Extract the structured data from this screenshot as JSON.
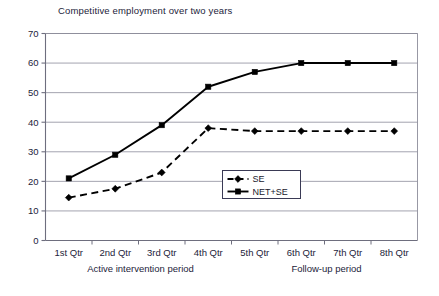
{
  "chart_data": {
    "type": "line",
    "title": "Competitive employment over two years",
    "xlabel": "",
    "ylabel": "",
    "categories": [
      "1st Qtr",
      "2nd Qtr",
      "3rd Qtr",
      "4th Qtr",
      "5th Qtr",
      "6th Qtr",
      "7th Qtr",
      "8th Qtr"
    ],
    "series": [
      {
        "name": "SE",
        "values": [
          14.5,
          17.5,
          23,
          38,
          37,
          37,
          37,
          37
        ],
        "marker": "diamond",
        "line_style": "dashed",
        "color": "#000000"
      },
      {
        "name": "NET+SE",
        "values": [
          21,
          29,
          39,
          52,
          57,
          60,
          60,
          60
        ],
        "marker": "square",
        "line_style": "solid",
        "color": "#000000"
      }
    ],
    "ylim": [
      0,
      70
    ],
    "ytick_labels": [
      "0",
      "10",
      "20",
      "30",
      "40",
      "50",
      "60",
      "70"
    ],
    "yticks": [
      0,
      10,
      20,
      30,
      40,
      50,
      60,
      70
    ],
    "grid": true,
    "grid_axis": "y",
    "legend_position": "center",
    "annotations": [
      {
        "text": "Active intervention period",
        "quarter_span": "1st Qtr - 4th Qtr"
      },
      {
        "text": "Follow-up period",
        "quarter_span": "5th Qtr - 8th Qtr"
      }
    ]
  },
  "legend": {
    "entries": [
      {
        "label": "SE"
      },
      {
        "label": "NET+SE"
      }
    ]
  },
  "axis": {
    "tick_labels_y": [
      "70",
      "60",
      "50",
      "40",
      "30",
      "20",
      "10",
      "0"
    ],
    "tick_labels_x": [
      "1st Qtr",
      "2nd Qtr",
      "3rd Qtr",
      "4th Qtr",
      "5th Qtr",
      "6th Qtr",
      "7th Qtr",
      "8th Qtr"
    ]
  },
  "annotations": {
    "active": "Active intervention period",
    "followup": "Follow-up period"
  },
  "colors": {
    "line": "#000000",
    "grid": "#8c8c9a",
    "axis": "#6e6e7e",
    "text": "#23233a",
    "background": "#ffffff"
  }
}
